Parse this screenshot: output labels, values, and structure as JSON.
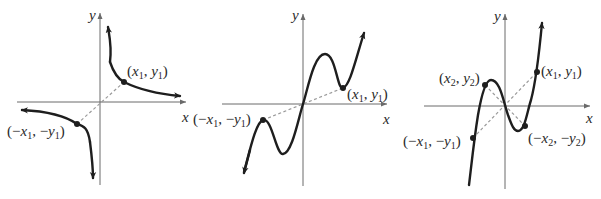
{
  "figure": {
    "panels": [
      {
        "id": "panel-1",
        "axis_labels": {
          "x": "x",
          "y": "y"
        },
        "points": [
          {
            "label": "(x1, y1)",
            "name": "x1-y1"
          },
          {
            "label": "(−x1, −y1)",
            "name": "neg-x1-neg-y1"
          }
        ]
      },
      {
        "id": "panel-2",
        "axis_labels": {
          "x": "x",
          "y": "y"
        },
        "points": [
          {
            "label": "(x1, y1)",
            "name": "x1-y1"
          },
          {
            "label": "(−x1, −y1)",
            "name": "neg-x1-neg-y1"
          }
        ]
      },
      {
        "id": "panel-3",
        "axis_labels": {
          "x": "x",
          "y": "y"
        },
        "points": [
          {
            "label": "(x1, y1)",
            "name": "x1-y1"
          },
          {
            "label": "(x2, y2)",
            "name": "x2-y2"
          },
          {
            "label": "(−x1, −y1)",
            "name": "neg-x1-neg-y1"
          },
          {
            "label": "(−x2, −y2)",
            "name": "neg-x2-neg-y2"
          }
        ]
      }
    ],
    "colors": {
      "curve": "#1e1e1e",
      "axis": "#6a6a6a",
      "dashed": "#9a9a9a"
    }
  }
}
